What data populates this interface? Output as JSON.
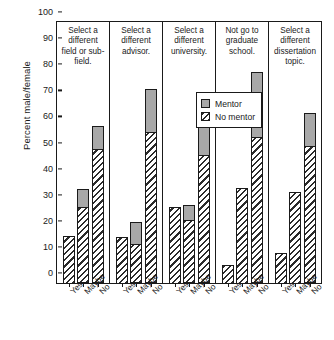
{
  "chart_data": {
    "type": "bar",
    "title": "",
    "subtitle": "",
    "xlabel": "",
    "ylabel": "Percent male/female",
    "ylim": [
      0,
      100
    ],
    "yticks": [
      0,
      10,
      20,
      30,
      40,
      50,
      60,
      70,
      80,
      90,
      100
    ],
    "grid": false,
    "stacked": true,
    "legend_position": "upper-center-inside",
    "categories": [
      "Yes",
      "Maybe",
      "No"
    ],
    "legend": [
      "Mentor",
      "No mentor"
    ],
    "series": [
      {
        "name": "No mentor",
        "fill": "hatched",
        "color": "#ffffff"
      },
      {
        "name": "Mentor",
        "fill": "solid",
        "color": "#a8a8a8"
      }
    ],
    "panels": [
      {
        "title": "Select a different field or sub-field.",
        "bars": [
          {
            "category": "Yes",
            "no_mentor": 18.0,
            "mentor": 0.0,
            "total": 18.0
          },
          {
            "category": "Maybe",
            "no_mentor": 29.0,
            "mentor": 7.0,
            "total": 36.0
          },
          {
            "category": "No",
            "no_mentor": 51.5,
            "mentor": 8.5,
            "total": 60.0
          }
        ]
      },
      {
        "title": "Select a different advisor.",
        "bars": [
          {
            "category": "Yes",
            "no_mentor": 17.5,
            "mentor": 0.0,
            "total": 17.5
          },
          {
            "category": "Maybe",
            "no_mentor": 15.0,
            "mentor": 8.5,
            "total": 23.5
          },
          {
            "category": "No",
            "no_mentor": 58.0,
            "mentor": 16.5,
            "total": 74.5
          }
        ]
      },
      {
        "title": "Select a different university.",
        "bars": [
          {
            "category": "Yes",
            "no_mentor": 29.0,
            "mentor": 0.0,
            "total": 29.0
          },
          {
            "category": "Maybe",
            "no_mentor": 24.0,
            "mentor": 6.0,
            "total": 30.0
          },
          {
            "category": "No",
            "no_mentor": 49.0,
            "mentor": 13.5,
            "total": 62.5
          }
        ]
      },
      {
        "title": "Not go to graduate school.",
        "bars": [
          {
            "category": "Yes",
            "no_mentor": 7.0,
            "mentor": 0.0,
            "total": 7.0
          },
          {
            "category": "Maybe",
            "no_mentor": 36.5,
            "mentor": 0.0,
            "total": 36.5
          },
          {
            "category": "No",
            "no_mentor": 56.0,
            "mentor": 25.0,
            "total": 81.0
          }
        ]
      },
      {
        "title": "Select a different dissertation topic.",
        "bars": [
          {
            "category": "Yes",
            "no_mentor": 11.5,
            "mentor": 0.0,
            "total": 11.5
          },
          {
            "category": "Maybe",
            "no_mentor": 35.0,
            "mentor": 0.0,
            "total": 35.0
          },
          {
            "category": "No",
            "no_mentor": 52.5,
            "mentor": 12.5,
            "total": 65.0
          }
        ]
      }
    ]
  }
}
